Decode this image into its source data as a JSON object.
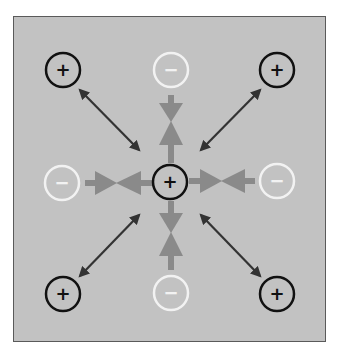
{
  "diagram": {
    "colors": {
      "background": "#c2c2c2",
      "frame_border": "#5a5a5a",
      "positive_stroke": "#111111",
      "negative_stroke": "#f2f2f2",
      "attraction_arrow": "#8a8a8a",
      "repulsion_arrow": "#333333"
    },
    "charges": [
      {
        "id": "center",
        "sign": "+",
        "type": "positive",
        "cx": 170,
        "cy": 182
      },
      {
        "id": "top-left",
        "sign": "+",
        "type": "positive",
        "cx": 63,
        "cy": 70
      },
      {
        "id": "top-right",
        "sign": "+",
        "type": "positive",
        "cx": 277,
        "cy": 70
      },
      {
        "id": "bottom-left",
        "sign": "+",
        "type": "positive",
        "cx": 63,
        "cy": 294
      },
      {
        "id": "bottom-right",
        "sign": "+",
        "type": "positive",
        "cx": 277,
        "cy": 294
      },
      {
        "id": "top",
        "sign": "−",
        "type": "negative",
        "cx": 171,
        "cy": 70
      },
      {
        "id": "left",
        "sign": "−",
        "type": "negative",
        "cx": 62,
        "cy": 183
      },
      {
        "id": "right",
        "sign": "−",
        "type": "negative",
        "cx": 277,
        "cy": 181
      },
      {
        "id": "bottom",
        "sign": "−",
        "type": "negative",
        "cx": 171,
        "cy": 293
      }
    ],
    "arrows": {
      "repulsion": [
        "top-left",
        "top-right",
        "bottom-left",
        "bottom-right"
      ],
      "attraction": [
        "top",
        "left",
        "right",
        "bottom"
      ]
    }
  }
}
